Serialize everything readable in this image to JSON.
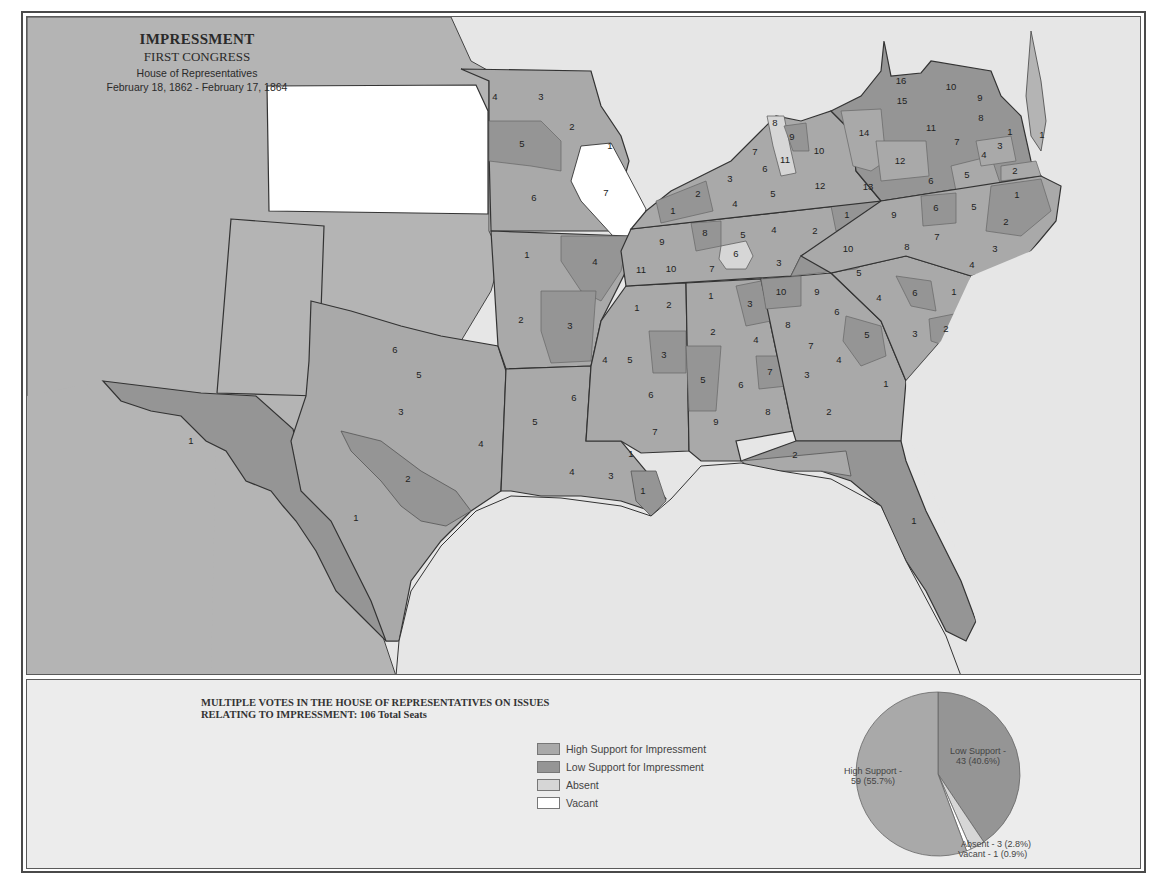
{
  "title": {
    "main": "IMPRESSMENT",
    "congress": "FIRST CONGRESS",
    "chamber": "House of Representatives",
    "dates": "February 18, 1862 - February 17, 1864"
  },
  "colors": {
    "high_support": "#a9a9a9",
    "low_support": "#959595",
    "absent": "#d6d6d6",
    "vacant": "#ffffff",
    "other_land": "#b4b4b4",
    "water": "#e6e6e6",
    "border": "#333333"
  },
  "legend": {
    "title_line1": "MULTIPLE VOTES IN THE HOUSE OF REPRESENTATIVES ON ISSUES",
    "title_line2": "RELATING TO IMPRESSMENT:   106  Total Seats",
    "items": [
      {
        "label": "High Support for Impressment",
        "color": "#a9a9a9"
      },
      {
        "label": "Low Support for Impressment",
        "color": "#959595"
      },
      {
        "label": "Absent",
        "color": "#d6d6d6"
      },
      {
        "label": "Vacant",
        "color": "#ffffff"
      }
    ]
  },
  "pie": {
    "high_label": "High Support -",
    "high_value": "59 (55.7%)",
    "low_label": "Low Support -",
    "low_value": "43 (40.6%)",
    "absent_label": "Absent - 3 (2.8%)",
    "vacant_label": "Vacant - 1 (0.9%)"
  },
  "chart_data": {
    "type": "pie",
    "title": "Multiple votes in the House of Representatives on issues relating to Impressment: 106 Total Seats",
    "categories": [
      "High Support",
      "Low Support",
      "Absent",
      "Vacant"
    ],
    "values": [
      59,
      43,
      3,
      1
    ],
    "percent": [
      55.7,
      40.6,
      2.8,
      0.9
    ],
    "colors": [
      "#a9a9a9",
      "#959595",
      "#d6d6d6",
      "#ffffff"
    ],
    "total_seats": 106
  },
  "districts": [
    {
      "state": "Missouri",
      "n": "4",
      "x": 494,
      "y": 96,
      "s": "high"
    },
    {
      "state": "Missouri",
      "n": "3",
      "x": 540,
      "y": 96,
      "s": "high"
    },
    {
      "state": "Missouri",
      "n": "2",
      "x": 571,
      "y": 126,
      "s": "high"
    },
    {
      "state": "Missouri",
      "n": "1",
      "x": 609,
      "y": 145,
      "s": "high"
    },
    {
      "state": "Missouri",
      "n": "5",
      "x": 521,
      "y": 143,
      "s": "low"
    },
    {
      "state": "Missouri",
      "n": "6",
      "x": 533,
      "y": 197,
      "s": "high"
    },
    {
      "state": "Missouri",
      "n": "7",
      "x": 605,
      "y": 192,
      "s": "vacant"
    },
    {
      "state": "Arkansas",
      "n": "1",
      "x": 526,
      "y": 254,
      "s": "high"
    },
    {
      "state": "Arkansas",
      "n": "4",
      "x": 594,
      "y": 261,
      "s": "low"
    },
    {
      "state": "Arkansas",
      "n": "2",
      "x": 520,
      "y": 319,
      "s": "high"
    },
    {
      "state": "Arkansas",
      "n": "3",
      "x": 569,
      "y": 325,
      "s": "low"
    },
    {
      "state": "Kentucky",
      "n": "1",
      "x": 672,
      "y": 210,
      "s": "low"
    },
    {
      "state": "Kentucky",
      "n": "2",
      "x": 697,
      "y": 193,
      "s": "low"
    },
    {
      "state": "Kentucky",
      "n": "3",
      "x": 729,
      "y": 178,
      "s": "high"
    },
    {
      "state": "Kentucky",
      "n": "4",
      "x": 734,
      "y": 203,
      "s": "high"
    },
    {
      "state": "Kentucky",
      "n": "5",
      "x": 772,
      "y": 193,
      "s": "high"
    },
    {
      "state": "Kentucky",
      "n": "6",
      "x": 764,
      "y": 168,
      "s": "high"
    },
    {
      "state": "Kentucky",
      "n": "7",
      "x": 754,
      "y": 151,
      "s": "high"
    },
    {
      "state": "Kentucky",
      "n": "8",
      "x": 774,
      "y": 122,
      "s": "absent"
    },
    {
      "state": "Kentucky",
      "n": "9",
      "x": 791,
      "y": 136,
      "s": "low"
    },
    {
      "state": "Kentucky",
      "n": "10",
      "x": 818,
      "y": 150,
      "s": "high"
    },
    {
      "state": "Kentucky",
      "n": "11",
      "x": 784,
      "y": 159,
      "s": "absent"
    },
    {
      "state": "Kentucky",
      "n": "12",
      "x": 819,
      "y": 185,
      "s": "high"
    },
    {
      "state": "Tennessee",
      "n": "9",
      "x": 661,
      "y": 241,
      "s": "high"
    },
    {
      "state": "Tennessee",
      "n": "10",
      "x": 670,
      "y": 268,
      "s": "high"
    },
    {
      "state": "Tennessee",
      "n": "11",
      "x": 640,
      "y": 269,
      "s": "high"
    },
    {
      "state": "Tennessee",
      "n": "8",
      "x": 704,
      "y": 232,
      "s": "low"
    },
    {
      "state": "Tennessee",
      "n": "7",
      "x": 711,
      "y": 268,
      "s": "high"
    },
    {
      "state": "Tennessee",
      "n": "5",
      "x": 742,
      "y": 234,
      "s": "high"
    },
    {
      "state": "Tennessee",
      "n": "6",
      "x": 735,
      "y": 253,
      "s": "absent"
    },
    {
      "state": "Tennessee",
      "n": "4",
      "x": 773,
      "y": 229,
      "s": "high"
    },
    {
      "state": "Tennessee",
      "n": "3",
      "x": 778,
      "y": 262,
      "s": "high"
    },
    {
      "state": "Tennessee",
      "n": "2",
      "x": 814,
      "y": 230,
      "s": "high"
    },
    {
      "state": "Tennessee",
      "n": "1",
      "x": 846,
      "y": 214,
      "s": "low"
    },
    {
      "state": "Tennessee",
      "n": "10",
      "x": 847,
      "y": 248,
      "s": "low"
    },
    {
      "state": "Virginia",
      "n": "16",
      "x": 900,
      "y": 80,
      "s": "low"
    },
    {
      "state": "Virginia",
      "n": "15",
      "x": 901,
      "y": 100,
      "s": "low"
    },
    {
      "state": "Virginia",
      "n": "10",
      "x": 950,
      "y": 86,
      "s": "low"
    },
    {
      "state": "Virginia",
      "n": "9",
      "x": 979,
      "y": 97,
      "s": "low"
    },
    {
      "state": "Virginia",
      "n": "8",
      "x": 980,
      "y": 117,
      "s": "low"
    },
    {
      "state": "Virginia",
      "n": "14",
      "x": 863,
      "y": 132,
      "s": "high"
    },
    {
      "state": "Virginia",
      "n": "11",
      "x": 930,
      "y": 127,
      "s": "low"
    },
    {
      "state": "Virginia",
      "n": "7",
      "x": 956,
      "y": 141,
      "s": "low"
    },
    {
      "state": "Virginia",
      "n": "1",
      "x": 1009,
      "y": 131,
      "s": "low"
    },
    {
      "state": "Virginia",
      "n": "3",
      "x": 999,
      "y": 145,
      "s": "high"
    },
    {
      "state": "Virginia",
      "n": "4",
      "x": 983,
      "y": 154,
      "s": "high"
    },
    {
      "state": "Virginia",
      "n": "12",
      "x": 899,
      "y": 160,
      "s": "high"
    },
    {
      "state": "Virginia",
      "n": "6",
      "x": 930,
      "y": 180,
      "s": "low"
    },
    {
      "state": "Virginia",
      "n": "5",
      "x": 966,
      "y": 174,
      "s": "high"
    },
    {
      "state": "Virginia",
      "n": "2",
      "x": 1014,
      "y": 170,
      "s": "high"
    },
    {
      "state": "Virginia",
      "n": "13",
      "x": 867,
      "y": 186,
      "s": "low"
    },
    {
      "state": "Virginia",
      "n": "1",
      "x": 1041,
      "y": 134,
      "s": "low"
    },
    {
      "state": "North Carolina",
      "n": "9",
      "x": 893,
      "y": 214,
      "s": "high"
    },
    {
      "state": "North Carolina",
      "n": "6",
      "x": 935,
      "y": 207,
      "s": "low"
    },
    {
      "state": "North Carolina",
      "n": "5",
      "x": 973,
      "y": 206,
      "s": "high"
    },
    {
      "state": "North Carolina",
      "n": "1",
      "x": 1016,
      "y": 194,
      "s": "low"
    },
    {
      "state": "North Carolina",
      "n": "2",
      "x": 1005,
      "y": 221,
      "s": "low"
    },
    {
      "state": "North Carolina",
      "n": "7",
      "x": 936,
      "y": 236,
      "s": "high"
    },
    {
      "state": "North Carolina",
      "n": "8",
      "x": 906,
      "y": 246,
      "s": "high"
    },
    {
      "state": "North Carolina",
      "n": "3",
      "x": 994,
      "y": 248,
      "s": "high"
    },
    {
      "state": "North Carolina",
      "n": "4",
      "x": 971,
      "y": 264,
      "s": "high"
    },
    {
      "state": "South Carolina",
      "n": "5",
      "x": 858,
      "y": 272,
      "s": "high"
    },
    {
      "state": "South Carolina",
      "n": "4",
      "x": 878,
      "y": 297,
      "s": "high"
    },
    {
      "state": "South Carolina",
      "n": "6",
      "x": 914,
      "y": 292,
      "s": "low"
    },
    {
      "state": "South Carolina",
      "n": "1",
      "x": 953,
      "y": 291,
      "s": "high"
    },
    {
      "state": "South Carolina",
      "n": "3",
      "x": 914,
      "y": 333,
      "s": "high"
    },
    {
      "state": "South Carolina",
      "n": "2",
      "x": 945,
      "y": 328,
      "s": "low"
    },
    {
      "state": "Georgia",
      "n": "10",
      "x": 780,
      "y": 291,
      "s": "low"
    },
    {
      "state": "Georgia",
      "n": "9",
      "x": 816,
      "y": 291,
      "s": "high"
    },
    {
      "state": "Georgia",
      "n": "6",
      "x": 836,
      "y": 311,
      "s": "high"
    },
    {
      "state": "Georgia",
      "n": "8",
      "x": 787,
      "y": 324,
      "s": "high"
    },
    {
      "state": "Georgia",
      "n": "7",
      "x": 810,
      "y": 345,
      "s": "high"
    },
    {
      "state": "Georgia",
      "n": "5",
      "x": 866,
      "y": 334,
      "s": "low"
    },
    {
      "state": "Georgia",
      "n": "4",
      "x": 838,
      "y": 359,
      "s": "high"
    },
    {
      "state": "Georgia",
      "n": "3",
      "x": 806,
      "y": 374,
      "s": "high"
    },
    {
      "state": "Georgia",
      "n": "1",
      "x": 885,
      "y": 383,
      "s": "high"
    },
    {
      "state": "Georgia",
      "n": "2",
      "x": 828,
      "y": 411,
      "s": "high"
    },
    {
      "state": "Alabama",
      "n": "1",
      "x": 710,
      "y": 295,
      "s": "high"
    },
    {
      "state": "Alabama",
      "n": "3",
      "x": 749,
      "y": 303,
      "s": "low"
    },
    {
      "state": "Alabama",
      "n": "2",
      "x": 712,
      "y": 331,
      "s": "high"
    },
    {
      "state": "Alabama",
      "n": "4",
      "x": 755,
      "y": 339,
      "s": "high"
    },
    {
      "state": "Alabama",
      "n": "5",
      "x": 702,
      "y": 379,
      "s": "low"
    },
    {
      "state": "Alabama",
      "n": "7",
      "x": 769,
      "y": 371,
      "s": "low"
    },
    {
      "state": "Alabama",
      "n": "6",
      "x": 740,
      "y": 384,
      "s": "high"
    },
    {
      "state": "Alabama",
      "n": "8",
      "x": 767,
      "y": 411,
      "s": "high"
    },
    {
      "state": "Alabama",
      "n": "9",
      "x": 715,
      "y": 421,
      "s": "high"
    },
    {
      "state": "Mississippi",
      "n": "1",
      "x": 636,
      "y": 307,
      "s": "high"
    },
    {
      "state": "Mississippi",
      "n": "2",
      "x": 668,
      "y": 304,
      "s": "high"
    },
    {
      "state": "Mississippi",
      "n": "4",
      "x": 604,
      "y": 359,
      "s": "high"
    },
    {
      "state": "Mississippi",
      "n": "5",
      "x": 629,
      "y": 359,
      "s": "high"
    },
    {
      "state": "Mississippi",
      "n": "3",
      "x": 663,
      "y": 354,
      "s": "low"
    },
    {
      "state": "Mississippi",
      "n": "6",
      "x": 650,
      "y": 394,
      "s": "high"
    },
    {
      "state": "Mississippi",
      "n": "7",
      "x": 654,
      "y": 431,
      "s": "high"
    },
    {
      "state": "Florida",
      "n": "2",
      "x": 794,
      "y": 454,
      "s": "high"
    },
    {
      "state": "Florida",
      "n": "1",
      "x": 913,
      "y": 520,
      "s": "low"
    },
    {
      "state": "Louisiana",
      "n": "6",
      "x": 573,
      "y": 397,
      "s": "high"
    },
    {
      "state": "Louisiana",
      "n": "5",
      "x": 534,
      "y": 421,
      "s": "high"
    },
    {
      "state": "Louisiana",
      "n": "4",
      "x": 571,
      "y": 471,
      "s": "high"
    },
    {
      "state": "Louisiana",
      "n": "3",
      "x": 610,
      "y": 475,
      "s": "high"
    },
    {
      "state": "Louisiana",
      "n": "1",
      "x": 630,
      "y": 453,
      "s": "high"
    },
    {
      "state": "Louisiana",
      "n": "1",
      "x": 642,
      "y": 490,
      "s": "low"
    },
    {
      "state": "Texas",
      "n": "6",
      "x": 394,
      "y": 349,
      "s": "high"
    },
    {
      "state": "Texas",
      "n": "5",
      "x": 418,
      "y": 374,
      "s": "high"
    },
    {
      "state": "Texas",
      "n": "3",
      "x": 400,
      "y": 411,
      "s": "high"
    },
    {
      "state": "Texas",
      "n": "4",
      "x": 480,
      "y": 443,
      "s": "high"
    },
    {
      "state": "Texas",
      "n": "2",
      "x": 407,
      "y": 478,
      "s": "low"
    },
    {
      "state": "Texas",
      "n": "1",
      "x": 190,
      "y": 440,
      "s": "low"
    },
    {
      "state": "Texas",
      "n": "1",
      "x": 355,
      "y": 517,
      "s": "high"
    }
  ]
}
